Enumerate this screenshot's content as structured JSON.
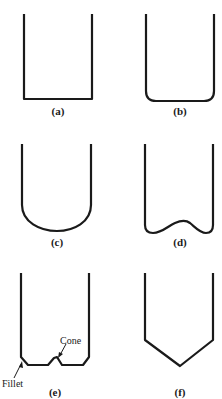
{
  "figure": {
    "panels": [
      {
        "id": "a",
        "label": "(a)",
        "description": "flat bottom vessel"
      },
      {
        "id": "b",
        "label": "(b)",
        "description": "flat bottom with rounded corners"
      },
      {
        "id": "c",
        "label": "(c)",
        "description": "hemispherical / dished bottom"
      },
      {
        "id": "d",
        "label": "(d)",
        "description": "torispherical bottom with central raised dome"
      },
      {
        "id": "e",
        "label": "(e)",
        "description": "flat bottom with fillet and central cone"
      },
      {
        "id": "f",
        "label": "(f)",
        "description": "conical bottom"
      }
    ],
    "annotations": {
      "cone": "Cone",
      "fillet": "Fillet"
    },
    "stroke_color": "#1a1a1a",
    "background": "#ffffff"
  }
}
